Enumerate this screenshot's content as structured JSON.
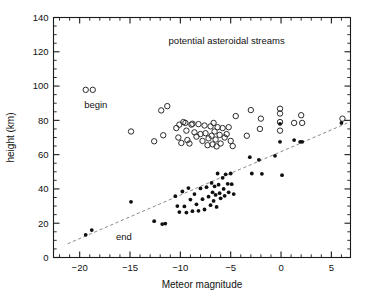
{
  "figure": {
    "background": "#ffffff",
    "width": 365,
    "height": 300
  },
  "chart_data": {
    "type": "scatter",
    "title": "",
    "xlabel": "Meteor magnitude",
    "ylabel": "height (km)",
    "xlim": [
      -22.6,
      6.9
    ],
    "ylim": [
      0,
      140
    ],
    "grid": false,
    "legend": "inline-annotations",
    "x_ticks_major": [
      -20,
      -15,
      -10,
      -5,
      0,
      5
    ],
    "x_ticks_major_labels": [
      "−20",
      "−15",
      "−10",
      "−5",
      "0",
      "5"
    ],
    "x_tick_minor_step": 1,
    "y_ticks_major": [
      0,
      20,
      40,
      60,
      80,
      100,
      120,
      140
    ],
    "y_ticks_major_labels": [
      "0",
      "20",
      "40",
      "60",
      "80",
      "100",
      "120",
      "140"
    ],
    "y_tick_minor_step": 5,
    "annotations": [
      {
        "text": "potential asteroidal streams",
        "x": -5.4,
        "y": 124.5,
        "anchor": "middle"
      },
      {
        "text": "begin",
        "x": -18.4,
        "y": 87.5,
        "anchor": "middle"
      },
      {
        "text": "end",
        "x": -15.6,
        "y": 10.5,
        "anchor": "middle"
      }
    ],
    "trend_line": {
      "name": "end-height trend",
      "style": "dashed",
      "color": "#8a8a8a",
      "x": [
        -21.2,
        6.6
      ],
      "y": [
        8.0,
        78.5
      ]
    },
    "series": [
      {
        "name": "begin",
        "marker": "open-circle",
        "color": "#2b2b2b",
        "points": [
          [
            -19.4,
            97.8
          ],
          [
            -18.7,
            97.8
          ],
          [
            -14.9,
            73.5
          ],
          [
            -12.6,
            67.8
          ],
          [
            -11.9,
            85.8
          ],
          [
            -11.7,
            71.3
          ],
          [
            -11.3,
            88.3
          ],
          [
            -10.4,
            75.5
          ],
          [
            -10.2,
            70.0
          ],
          [
            -10.1,
            77.5
          ],
          [
            -9.9,
            66.8
          ],
          [
            -9.7,
            79.0
          ],
          [
            -9.5,
            78.5
          ],
          [
            -9.4,
            74.0
          ],
          [
            -9.3,
            68.5
          ],
          [
            -9.1,
            66.5
          ],
          [
            -8.9,
            77.5
          ],
          [
            -8.8,
            78.0
          ],
          [
            -8.6,
            73.0
          ],
          [
            -8.4,
            70.5
          ],
          [
            -8.2,
            77.8
          ],
          [
            -8.0,
            72.0
          ],
          [
            -7.8,
            68.0
          ],
          [
            -7.6,
            77.0
          ],
          [
            -7.5,
            72.5
          ],
          [
            -7.3,
            65.5
          ],
          [
            -7.2,
            69.5
          ],
          [
            -7.0,
            76.5
          ],
          [
            -6.9,
            71.0
          ],
          [
            -6.8,
            66.0
          ],
          [
            -6.7,
            78.5
          ],
          [
            -6.6,
            73.5
          ],
          [
            -6.5,
            68.8
          ],
          [
            -6.4,
            64.8
          ],
          [
            -6.3,
            76.0
          ],
          [
            -6.1,
            71.5
          ],
          [
            -6.0,
            66.5
          ],
          [
            -5.8,
            75.5
          ],
          [
            -5.6,
            70.0
          ],
          [
            -5.4,
            72.0
          ],
          [
            -5.2,
            76.0
          ],
          [
            -5.0,
            68.0
          ],
          [
            -4.8,
            65.0
          ],
          [
            -4.5,
            82.5
          ],
          [
            -3.4,
            71.0
          ],
          [
            -3.0,
            86.0
          ],
          [
            -2.1,
            75.0
          ],
          [
            -2.0,
            81.0
          ],
          [
            -0.1,
            86.8
          ],
          [
            -0.1,
            84.0
          ],
          [
            -0.1,
            79.0
          ],
          [
            -0.1,
            74.0
          ],
          [
            1.3,
            78.5
          ],
          [
            2.0,
            83.0
          ],
          [
            2.1,
            78.5
          ],
          [
            6.1,
            81.0
          ]
        ]
      },
      {
        "name": "end",
        "marker": "filled-circle",
        "color": "#101010",
        "points": [
          [
            -19.4,
            13.2
          ],
          [
            -18.8,
            16.0
          ],
          [
            -14.9,
            32.5
          ],
          [
            -12.6,
            21.2
          ],
          [
            -11.8,
            19.5
          ],
          [
            -11.5,
            19.8
          ],
          [
            -10.5,
            35.8
          ],
          [
            -10.3,
            30.0
          ],
          [
            -10.1,
            26.5
          ],
          [
            -9.8,
            38.5
          ],
          [
            -9.6,
            29.8
          ],
          [
            -9.4,
            26.2
          ],
          [
            -9.2,
            40.5
          ],
          [
            -9.0,
            33.8
          ],
          [
            -8.8,
            27.0
          ],
          [
            -8.6,
            37.0
          ],
          [
            -8.4,
            31.0
          ],
          [
            -8.2,
            27.2
          ],
          [
            -8.0,
            40.3
          ],
          [
            -7.8,
            34.0
          ],
          [
            -7.6,
            28.0
          ],
          [
            -7.4,
            41.0
          ],
          [
            -7.2,
            35.5
          ],
          [
            -7.0,
            30.5
          ],
          [
            -6.9,
            43.5
          ],
          [
            -6.8,
            38.0
          ],
          [
            -6.7,
            33.0
          ],
          [
            -6.6,
            41.5
          ],
          [
            -6.5,
            36.5
          ],
          [
            -6.4,
            29.5
          ],
          [
            -6.3,
            49.0
          ],
          [
            -6.2,
            42.5
          ],
          [
            -6.1,
            37.5
          ],
          [
            -6.0,
            34.5
          ],
          [
            -5.8,
            46.5
          ],
          [
            -5.7,
            40.0
          ],
          [
            -5.6,
            36.0
          ],
          [
            -5.5,
            48.5
          ],
          [
            -5.3,
            43.0
          ],
          [
            -5.2,
            38.0
          ],
          [
            -5.0,
            49.0
          ],
          [
            -4.9,
            42.8
          ],
          [
            -4.7,
            37.0
          ],
          [
            -3.1,
            58.5
          ],
          [
            -2.9,
            49.0
          ],
          [
            -2.2,
            57.0
          ],
          [
            -1.9,
            48.8
          ],
          [
            -0.6,
            59.3
          ],
          [
            -0.1,
            78.0
          ],
          [
            -0.1,
            67.5
          ],
          [
            0.1,
            48.0
          ],
          [
            1.3,
            68.5
          ],
          [
            1.9,
            67.5
          ],
          [
            2.1,
            67.5
          ],
          [
            6.0,
            78.5
          ]
        ]
      }
    ]
  }
}
